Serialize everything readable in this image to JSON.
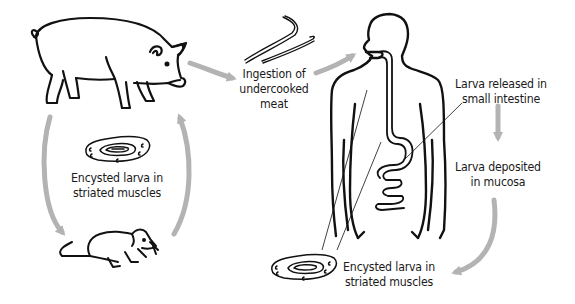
{
  "diagram": {
    "colors": {
      "outline": "#111111",
      "arrow": "#b3b3b3",
      "text": "#1a1a1a",
      "background": "#ffffff"
    },
    "nodes": [
      {
        "id": "pig",
        "icon": "pig-icon"
      },
      {
        "id": "rat",
        "icon": "rat-icon"
      },
      {
        "id": "meat-larvae",
        "icon": "larvae-worm-icon"
      },
      {
        "id": "human",
        "icon": "human-digestive-tract-icon"
      },
      {
        "id": "cyst-left",
        "icon": "encysted-larva-icon"
      },
      {
        "id": "cyst-right",
        "icon": "encysted-larva-icon"
      }
    ],
    "labels": {
      "ingestion": {
        "line1": "Ingestion of",
        "line2": "undercooked",
        "line3": "meat"
      },
      "released": {
        "line1": "Larva released in",
        "line2": "small intestine"
      },
      "deposited": {
        "line1": "Larva deposited",
        "line2": "in mucosa"
      },
      "cyst_left": {
        "line1": "Encysted larva in",
        "line2": "striated muscles"
      },
      "cyst_right": {
        "line1": "Encysted larva in",
        "line2": "striated muscles"
      }
    },
    "edges": [
      {
        "from": "pig",
        "to": "ingestion"
      },
      {
        "from": "ingestion",
        "to": "human"
      },
      {
        "from": "released",
        "to": "deposited"
      },
      {
        "from": "deposited",
        "to": "cyst-right"
      },
      {
        "from": "pig",
        "to": "rat"
      },
      {
        "from": "rat",
        "to": "pig"
      }
    ]
  }
}
